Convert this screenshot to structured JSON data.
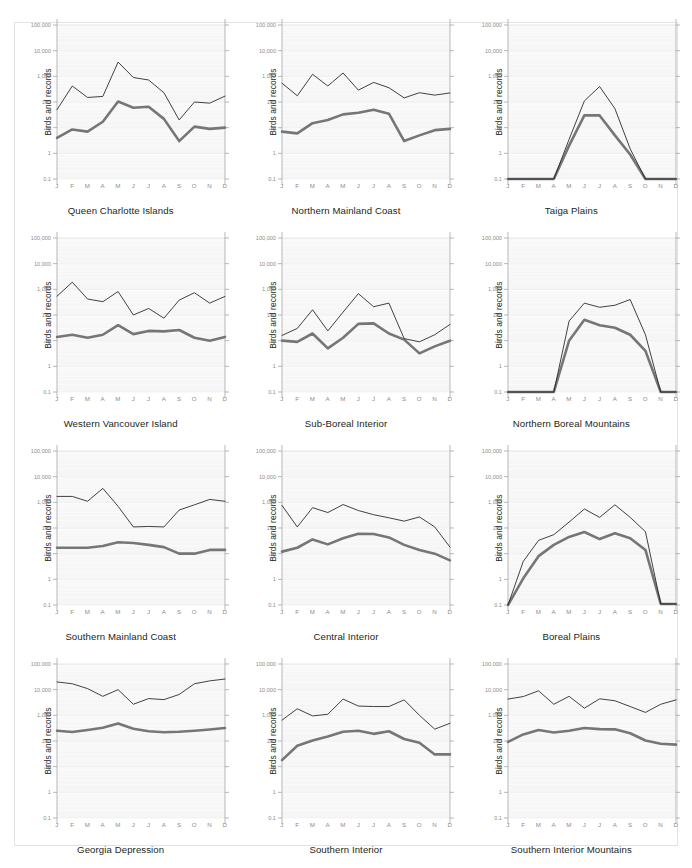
{
  "figure": {
    "title": "",
    "y_axis_label": "Birds and records",
    "months": [
      "J",
      "F",
      "M",
      "A",
      "M",
      "J",
      "J",
      "A",
      "S",
      "O",
      "N",
      "D"
    ],
    "y_ticks": [
      "100,000",
      "10,000",
      "1,000",
      "100",
      "10",
      "1",
      "0.1"
    ],
    "y_tick_values": [
      100000,
      10000,
      1000,
      100,
      10,
      1,
      0.1
    ],
    "colors": {
      "records_line": "#231f20",
      "birds_line": "#767676",
      "plot_background": "#f6f6f6",
      "gridline": "#e9e9e9",
      "axis": "#9a9a9a",
      "frame": "#e3e3e3",
      "page_background": "#ffffff"
    },
    "series_names": [
      "records",
      "birds"
    ]
  },
  "chart_data": [
    {
      "type": "line",
      "title": "Queen Charlotte Islands",
      "xlabel": "",
      "ylabel": "Birds and records",
      "yscale": "log",
      "ylim": [
        0.1,
        100000
      ],
      "grid": true,
      "legend": "none",
      "categories": [
        "J",
        "F",
        "M",
        "A",
        "M",
        "J",
        "J",
        "A",
        "S",
        "O",
        "N",
        "D"
      ],
      "series": [
        {
          "name": "records",
          "values": [
            50,
            420,
            150,
            165,
            3600,
            900,
            720,
            230,
            20,
            100,
            90,
            170
          ]
        },
        {
          "name": "birds",
          "values": [
            4,
            8.5,
            7,
            17,
            105,
            60,
            65,
            22,
            3,
            11,
            9,
            10
          ]
        }
      ]
    },
    {
      "type": "line",
      "title": "Northern Mainland Coast",
      "xlabel": "",
      "ylabel": "Birds and records",
      "yscale": "log",
      "ylim": [
        0.1,
        100000
      ],
      "grid": true,
      "legend": "none",
      "categories": [
        "J",
        "F",
        "M",
        "A",
        "M",
        "J",
        "J",
        "A",
        "S",
        "O",
        "N",
        "D"
      ],
      "series": [
        {
          "name": "records",
          "values": [
            540,
            175,
            1200,
            420,
            1350,
            290,
            580,
            360,
            145,
            230,
            185,
            225
          ]
        },
        {
          "name": "birds",
          "values": [
            7,
            6,
            15,
            20,
            33,
            38,
            50,
            35,
            3,
            5,
            8,
            9
          ]
        }
      ]
    },
    {
      "type": "line",
      "title": "Taiga Plains",
      "xlabel": "",
      "ylabel": "Birds and records",
      "yscale": "log",
      "ylim": [
        0.1,
        100000
      ],
      "grid": true,
      "legend": "none",
      "categories": [
        "J",
        "F",
        "M",
        "A",
        "M",
        "J",
        "J",
        "A",
        "S",
        "O",
        "N",
        "D"
      ],
      "series": [
        {
          "name": "records",
          "values": [
            0.1,
            0.1,
            0.1,
            0.1,
            3.5,
            110,
            400,
            55,
            1.5,
            0.1,
            0.1,
            0.1
          ]
        },
        {
          "name": "birds",
          "values": [
            0.1,
            0.1,
            0.1,
            0.1,
            2.0,
            30,
            30,
            5.0,
            0.9,
            0.1,
            0.1,
            0.1
          ]
        }
      ]
    },
    {
      "type": "line",
      "title": "Western Vancouver Island",
      "xlabel": "",
      "ylabel": "Birds and records",
      "yscale": "log",
      "ylim": [
        0.1,
        100000
      ],
      "grid": true,
      "legend": "none",
      "categories": [
        "J",
        "F",
        "M",
        "A",
        "M",
        "J",
        "J",
        "A",
        "S",
        "O",
        "N",
        "D"
      ],
      "series": [
        {
          "name": "records",
          "values": [
            540,
            1900,
            420,
            330,
            820,
            100,
            180,
            75,
            380,
            740,
            290,
            530
          ]
        },
        {
          "name": "birds",
          "values": [
            14,
            17,
            13,
            17,
            40,
            18,
            24,
            23,
            26,
            13,
            10,
            14
          ]
        }
      ]
    },
    {
      "type": "line",
      "title": "Sub-Boreal Interior",
      "xlabel": "",
      "ylabel": "Birds and records",
      "yscale": "log",
      "ylim": [
        0.1,
        100000
      ],
      "grid": true,
      "legend": "none",
      "categories": [
        "J",
        "F",
        "M",
        "A",
        "M",
        "J",
        "J",
        "A",
        "S",
        "O",
        "N",
        "D"
      ],
      "series": [
        {
          "name": "records",
          "values": [
            16,
            30,
            160,
            24,
            130,
            680,
            210,
            290,
            12,
            9,
            17,
            43
          ]
        },
        {
          "name": "birds",
          "values": [
            10,
            9,
            19,
            5,
            13,
            45,
            47,
            19,
            11,
            3.2,
            6,
            10
          ]
        }
      ]
    },
    {
      "type": "line",
      "title": "Northern Boreal Mountains",
      "xlabel": "",
      "ylabel": "Birds and records",
      "yscale": "log",
      "ylim": [
        0.1,
        100000
      ],
      "grid": true,
      "legend": "none",
      "categories": [
        "J",
        "F",
        "M",
        "A",
        "M",
        "J",
        "J",
        "A",
        "S",
        "O",
        "N",
        "D"
      ],
      "series": [
        {
          "name": "records",
          "values": [
            0.1,
            0.1,
            0.1,
            0.1,
            58,
            290,
            200,
            240,
            400,
            17,
            0.1,
            0.1
          ]
        },
        {
          "name": "birds",
          "values": [
            0.1,
            0.1,
            0.1,
            0.1,
            10,
            65,
            40,
            32,
            17,
            4,
            0.1,
            0.1
          ]
        }
      ]
    },
    {
      "type": "line",
      "title": "Southern Mainland Coast",
      "xlabel": "",
      "ylabel": "Birds and records",
      "yscale": "log",
      "ylim": [
        0.1,
        100000
      ],
      "grid": true,
      "legend": "none",
      "categories": [
        "J",
        "F",
        "M",
        "A",
        "M",
        "J",
        "J",
        "A",
        "S",
        "O",
        "N",
        "D"
      ],
      "series": [
        {
          "name": "records",
          "values": [
            1700,
            1700,
            1100,
            3500,
            700,
            110,
            115,
            110,
            500,
            800,
            1300,
            1100
          ]
        },
        {
          "name": "birds",
          "values": [
            17,
            17,
            17,
            20,
            28,
            26,
            22,
            18,
            10,
            10,
            14,
            14
          ]
        }
      ]
    },
    {
      "type": "line",
      "title": "Central Interior",
      "xlabel": "",
      "ylabel": "Birds and records",
      "yscale": "log",
      "ylim": [
        0.1,
        100000
      ],
      "grid": true,
      "legend": "none",
      "categories": [
        "J",
        "F",
        "M",
        "A",
        "M",
        "J",
        "J",
        "A",
        "S",
        "O",
        "N",
        "D"
      ],
      "series": [
        {
          "name": "records",
          "values": [
            760,
            110,
            620,
            400,
            820,
            480,
            330,
            250,
            185,
            270,
            110,
            18
          ]
        },
        {
          "name": "birds",
          "values": [
            12,
            17,
            36,
            23,
            40,
            60,
            58,
            43,
            22,
            14,
            10,
            5.5
          ]
        }
      ]
    },
    {
      "type": "line",
      "title": "Boreal Plains",
      "xlabel": "",
      "ylabel": "Birds and records",
      "yscale": "log",
      "ylim": [
        0.1,
        100000
      ],
      "grid": true,
      "legend": "none",
      "categories": [
        "J",
        "F",
        "M",
        "A",
        "M",
        "J",
        "J",
        "A",
        "S",
        "O",
        "N",
        "D"
      ],
      "series": [
        {
          "name": "records",
          "values": [
            0.1,
            5,
            33,
            55,
            170,
            550,
            260,
            800,
            260,
            72,
            0.11,
            0.11
          ]
        },
        {
          "name": "birds",
          "values": [
            0.1,
            1.1,
            8,
            22,
            45,
            70,
            37,
            62,
            40,
            14,
            0.11,
            0.11
          ]
        }
      ]
    },
    {
      "type": "line",
      "title": "Georgia Depression",
      "xlabel": "",
      "ylabel": "Birds and records",
      "yscale": "log",
      "ylim": [
        0.1,
        100000
      ],
      "grid": true,
      "legend": "none",
      "categories": [
        "J",
        "F",
        "M",
        "A",
        "M",
        "J",
        "J",
        "A",
        "S",
        "O",
        "N",
        "D"
      ],
      "series": [
        {
          "name": "records",
          "values": [
            20000,
            17000,
            11000,
            5500,
            10000,
            2700,
            4500,
            4100,
            6500,
            17000,
            22000,
            26000
          ]
        },
        {
          "name": "birds",
          "values": [
            250,
            225,
            270,
            330,
            480,
            300,
            240,
            220,
            230,
            250,
            280,
            320
          ]
        }
      ]
    },
    {
      "type": "line",
      "title": "Southern Interior",
      "xlabel": "",
      "ylabel": "Birds and records",
      "yscale": "log",
      "ylim": [
        0.1,
        100000
      ],
      "grid": true,
      "legend": "none",
      "categories": [
        "J",
        "F",
        "M",
        "A",
        "M",
        "J",
        "J",
        "A",
        "S",
        "O",
        "N",
        "D"
      ],
      "series": [
        {
          "name": "records",
          "values": [
            650,
            1800,
            950,
            1100,
            4300,
            2300,
            2200,
            2200,
            4000,
            1000,
            290,
            490
          ]
        },
        {
          "name": "birds",
          "values": [
            18,
            65,
            105,
            150,
            230,
            250,
            190,
            240,
            120,
            85,
            30,
            30
          ]
        }
      ]
    },
    {
      "type": "line",
      "title": "Southern Interior Mountains",
      "xlabel": "",
      "ylabel": "Birds and records",
      "yscale": "log",
      "ylim": [
        0.1,
        100000
      ],
      "grid": true,
      "legend": "none",
      "categories": [
        "J",
        "F",
        "M",
        "A",
        "M",
        "J",
        "J",
        "A",
        "S",
        "O",
        "N",
        "D"
      ],
      "series": [
        {
          "name": "records",
          "values": [
            4300,
            5400,
            9000,
            2700,
            5500,
            1900,
            4400,
            3700,
            2200,
            1300,
            2700,
            4000
          ]
        },
        {
          "name": "birds",
          "values": [
            92,
            180,
            270,
            215,
            250,
            320,
            290,
            285,
            200,
            105,
            78,
            72
          ]
        }
      ]
    }
  ]
}
